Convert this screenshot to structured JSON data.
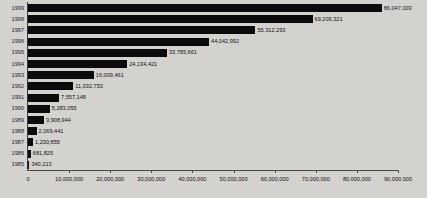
{
  "chart_data": {
    "type": "bar",
    "orientation": "horizontal",
    "title": "",
    "xlabel": "",
    "ylabel": "",
    "xlim": [
      0,
      90000000
    ],
    "grid": false,
    "legend": false,
    "categories": [
      "1999",
      "1998",
      "1997",
      "1996",
      "1995",
      "1994",
      "1993",
      "1992",
      "1991",
      "1990",
      "1989",
      "1988",
      "1987",
      "1986",
      "1985"
    ],
    "values": [
      86047003,
      69209321,
      55312293,
      44042992,
      33785661,
      24134421,
      16009461,
      11032753,
      7557148,
      5283055,
      3908944,
      2069441,
      1230855,
      681825,
      340213
    ],
    "value_labels": [
      "86,047,003",
      "69,209,321",
      "55,312,293",
      "44,042,992",
      "33,785,661",
      "24,134,421",
      "16,009,461",
      "11,032,753",
      "7,557,148",
      "5,283,055",
      "3,908,944",
      "2,069,441",
      "1,230,855",
      "681,825",
      "340,213"
    ],
    "xticks": [
      0,
      10000000,
      20000000,
      30000000,
      40000000,
      50000000,
      60000000,
      70000000,
      80000000,
      90000000
    ],
    "xtick_labels": [
      "0",
      "10,000,000",
      "20,000,000",
      "30,000,000",
      "40,000,000",
      "50,000,000",
      "60,000,000",
      "70,000,000",
      "80,000,000",
      "90,000,000"
    ],
    "bar_color": "#0b0b0b",
    "background_color": "#d4d2cf",
    "axis_color": "#4a4a4a"
  }
}
